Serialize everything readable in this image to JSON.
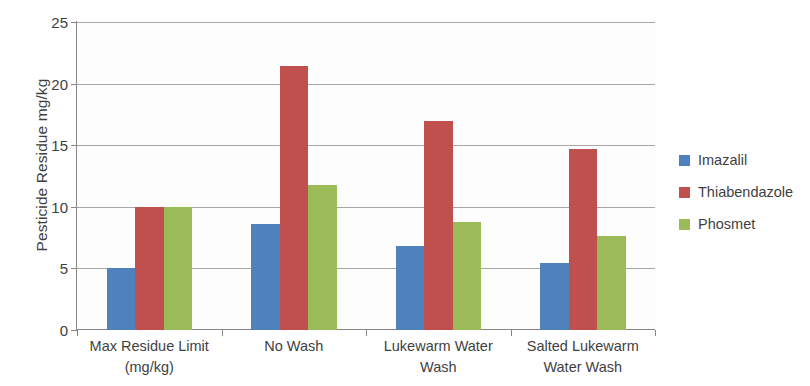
{
  "chart_data": {
    "type": "bar",
    "title": "",
    "subtitle": "",
    "xlabel": "",
    "ylabel": "Pesticide Residue mg/kg",
    "ylim": [
      0,
      25
    ],
    "ytick_step": 5,
    "yticks": [
      0,
      5,
      10,
      15,
      20,
      25
    ],
    "ytick_labels": [
      "0",
      "5",
      "10",
      "15",
      "20",
      "25"
    ],
    "grid": "horizontal",
    "legend_position": "right",
    "categories": [
      "Max Residue Limit (mg/kg)",
      "No Wash",
      "Lukewarm Water Wash",
      "Salted Lukewarm Water Wash"
    ],
    "category_label_lines": [
      [
        "Max Residue Limit",
        "(mg/kg)"
      ],
      [
        "No Wash",
        ""
      ],
      [
        "Lukewarm Water",
        "Wash"
      ],
      [
        "Salted Lukewarm",
        "Water Wash"
      ]
    ],
    "series": [
      {
        "name": "Imazalil",
        "color": "#4F81BD",
        "values": [
          5.0,
          8.6,
          6.8,
          5.4
        ]
      },
      {
        "name": "Thiabendazole",
        "color": "#C0504D",
        "values": [
          10.0,
          21.4,
          17.0,
          14.7
        ]
      },
      {
        "name": "Phosmet",
        "color": "#9BBB59",
        "values": [
          10.0,
          11.8,
          8.8,
          7.6
        ]
      }
    ]
  },
  "legend": {
    "items": [
      {
        "label": "Imazalil"
      },
      {
        "label": "Thiabendazole"
      },
      {
        "label": "Phosmet"
      }
    ]
  },
  "colors": {
    "series_1": "#4F81BD",
    "series_2": "#C0504D",
    "series_3": "#9BBB59",
    "gridline": "#A6A6A6",
    "axis": "#868686",
    "text": "#3F3F3F",
    "plot_background": "#FDFDFD"
  }
}
